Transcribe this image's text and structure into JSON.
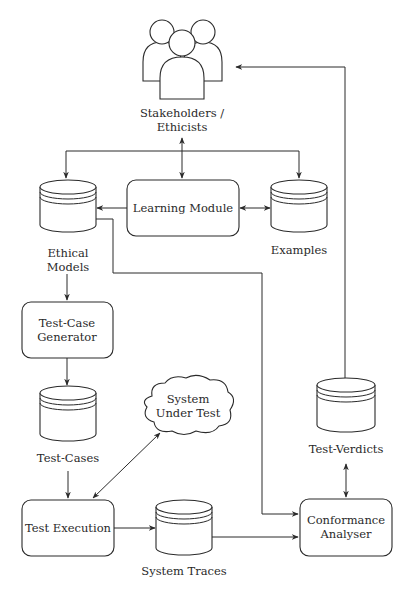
{
  "diagram": {
    "nodes": {
      "stakeholders": {
        "kind": "people-icon",
        "label_lines": [
          "Stakeholders /",
          "Ethicists"
        ]
      },
      "ethical_models": {
        "kind": "database",
        "label_lines": [
          "Ethical",
          "Models"
        ]
      },
      "learning_module": {
        "kind": "process",
        "label_lines": [
          "Learning Module"
        ]
      },
      "examples": {
        "kind": "database",
        "label_lines": [
          "Examples"
        ]
      },
      "test_case_generator": {
        "kind": "process",
        "label_lines": [
          "Test-Case",
          "Generator"
        ]
      },
      "test_cases": {
        "kind": "database",
        "label_lines": [
          "Test-Cases"
        ]
      },
      "system_under_test": {
        "kind": "cloud",
        "label_lines": [
          "System",
          "Under Test"
        ]
      },
      "test_verdicts": {
        "kind": "database",
        "label_lines": [
          "Test-Verdicts"
        ]
      },
      "test_execution": {
        "kind": "process",
        "label_lines": [
          "Test Execution"
        ]
      },
      "system_traces": {
        "kind": "database",
        "label_lines": [
          "System Traces"
        ]
      },
      "conformance_analyser": {
        "kind": "process",
        "label_lines": [
          "Conformance",
          "Analyser"
        ]
      }
    },
    "edges": [
      {
        "from": "stakeholders",
        "to": "learning_module",
        "direction": "both"
      },
      {
        "from": "stakeholders",
        "to": "ethical_models",
        "direction": "forward"
      },
      {
        "from": "stakeholders",
        "to": "examples",
        "direction": "forward"
      },
      {
        "from": "learning_module",
        "to": "ethical_models",
        "direction": "forward"
      },
      {
        "from": "learning_module",
        "to": "examples",
        "direction": "both"
      },
      {
        "from": "ethical_models",
        "to": "test_case_generator",
        "direction": "forward"
      },
      {
        "from": "ethical_models",
        "to": "conformance_analyser",
        "direction": "forward"
      },
      {
        "from": "test_case_generator",
        "to": "test_cases",
        "direction": "forward"
      },
      {
        "from": "test_cases",
        "to": "test_execution",
        "direction": "forward"
      },
      {
        "from": "test_execution",
        "to": "system_under_test",
        "direction": "both"
      },
      {
        "from": "test_execution",
        "to": "system_traces",
        "direction": "forward"
      },
      {
        "from": "system_traces",
        "to": "conformance_analyser",
        "direction": "forward"
      },
      {
        "from": "conformance_analyser",
        "to": "test_verdicts",
        "direction": "both"
      },
      {
        "from": "test_verdicts",
        "to": "stakeholders",
        "direction": "forward"
      }
    ],
    "colors": {
      "stroke": "#2a2a2a",
      "fill": "#ffffff",
      "background": "#ffffff"
    }
  }
}
